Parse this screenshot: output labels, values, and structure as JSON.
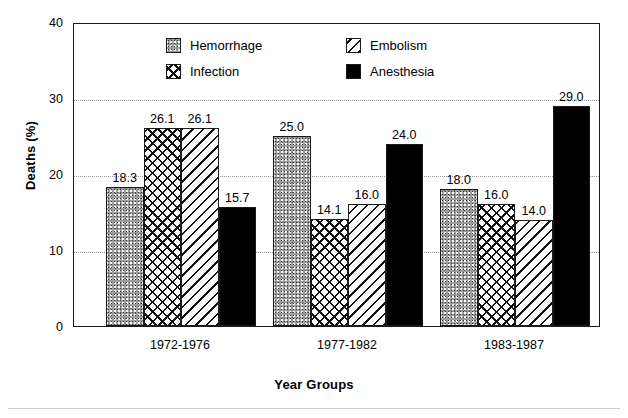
{
  "chart_data": {
    "type": "bar",
    "title": "",
    "xlabel": "Year Groups",
    "ylabel": "Deaths (%)",
    "categories": [
      "1972-1976",
      "1977-1982",
      "1983-1987"
    ],
    "ylim": [
      0,
      40
    ],
    "yticks": [
      0,
      10,
      20,
      30,
      40
    ],
    "ytick_labels": [
      "0",
      "10",
      "20",
      "30",
      "40"
    ],
    "grid": "horizontal-dotted",
    "legend_position": "upper-center-inside",
    "series": [
      {
        "name": "Hemorrhage",
        "pattern": "stipple-gray",
        "values": [
          18.3,
          25.0,
          18.0
        ],
        "labels": [
          "18.3",
          "25.0",
          "18.0"
        ]
      },
      {
        "name": "Infection",
        "pattern": "crosshatch",
        "values": [
          26.1,
          14.1,
          16.0
        ],
        "labels": [
          "26.1",
          "14.1",
          "16.0"
        ]
      },
      {
        "name": "Embolism",
        "pattern": "diagonal-hatch",
        "values": [
          26.1,
          16.0,
          14.0
        ],
        "labels": [
          "26.1",
          "16.0",
          "14.0"
        ]
      },
      {
        "name": "Anesthesia",
        "pattern": "solid-black",
        "values": [
          15.7,
          24.0,
          29.0
        ],
        "labels": [
          "15.7",
          "24.0",
          "29.0"
        ]
      }
    ]
  },
  "colors": {
    "axis": "#1a1a1a",
    "grid": "#9a9a9a",
    "hemorrhage": "#9d9d9d",
    "infection": "#ffffff",
    "embolism": "#ffffff",
    "anesthesia": "#000000",
    "background": "#ffffff"
  }
}
